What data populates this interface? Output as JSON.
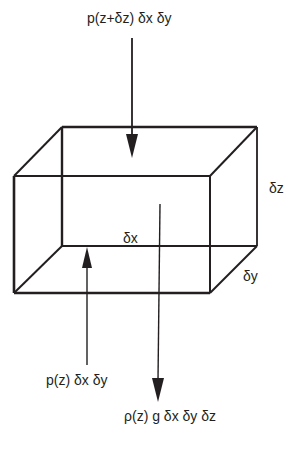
{
  "diagram": {
    "type": "force-balance-on-fluid-element",
    "shape": "rectangular box (3D wireframe)",
    "labels": {
      "top_force": "p(z+δz) δx δy",
      "bottom_force": "p(z) δx δy",
      "weight": "ρ(z) g δx δy δz",
      "dimension_x": "δx",
      "dimension_y": "δy",
      "dimension_z": "δz"
    },
    "arrows": [
      {
        "name": "top-pressure-force",
        "direction": "down",
        "label_ref": "top_force"
      },
      {
        "name": "bottom-pressure-force",
        "direction": "up",
        "label_ref": "bottom_force"
      },
      {
        "name": "weight-force",
        "direction": "down",
        "label_ref": "weight"
      }
    ],
    "colors": {
      "stroke": "#231f20",
      "background": "#ffffff"
    }
  }
}
